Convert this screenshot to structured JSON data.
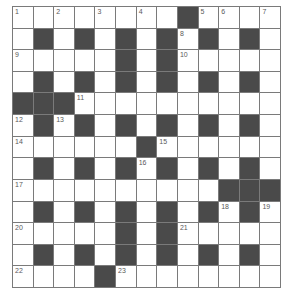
{
  "puzzle": {
    "type": "crossword",
    "rows": 13,
    "cols": 13,
    "colors": {
      "block": "#4a4a4a",
      "cell": "#ffffff",
      "border": "#7a7a7a",
      "number": "#5a5a5a"
    },
    "legend": "B = black square, . = empty white square, digits = clue number in white square",
    "grid": [
      [
        "1",
        ".",
        "2",
        ".",
        "3",
        ".",
        "4",
        ".",
        "B",
        "5",
        "6",
        ".",
        "7"
      ],
      [
        ".",
        "B",
        ".",
        "B",
        ".",
        "B",
        ".",
        "B",
        "8",
        "B",
        ".",
        "B",
        "."
      ],
      [
        "9",
        ".",
        ".",
        ".",
        ".",
        "B",
        ".",
        "B",
        "10",
        ".",
        ".",
        ".",
        "."
      ],
      [
        ".",
        "B",
        ".",
        "B",
        ".",
        "B",
        ".",
        "B",
        ".",
        "B",
        ".",
        "B",
        "."
      ],
      [
        "B",
        "B",
        "B",
        "11",
        ".",
        ".",
        ".",
        ".",
        ".",
        ".",
        ".",
        ".",
        "."
      ],
      [
        "12",
        "B",
        "13",
        "B",
        ".",
        "B",
        ".",
        "B",
        ".",
        "B",
        ".",
        "B",
        "."
      ],
      [
        "14",
        ".",
        ".",
        ".",
        ".",
        ".",
        "B",
        "15",
        ".",
        ".",
        ".",
        ".",
        "."
      ],
      [
        ".",
        "B",
        ".",
        "B",
        ".",
        "B",
        "16",
        "B",
        ".",
        "B",
        ".",
        "B",
        "."
      ],
      [
        "17",
        ".",
        ".",
        ".",
        ".",
        ".",
        ".",
        ".",
        ".",
        ".",
        "B",
        "B",
        "B"
      ],
      [
        ".",
        "B",
        ".",
        "B",
        ".",
        "B",
        ".",
        "B",
        ".",
        "B",
        "18",
        "B",
        "19"
      ],
      [
        "20",
        ".",
        ".",
        ".",
        ".",
        "B",
        ".",
        "B",
        "21",
        ".",
        ".",
        ".",
        "."
      ],
      [
        ".",
        "B",
        ".",
        "B",
        ".",
        "B",
        ".",
        "B",
        ".",
        "B",
        ".",
        "B",
        "."
      ],
      [
        "22",
        ".",
        ".",
        ".",
        "B",
        "23",
        ".",
        ".",
        ".",
        ".",
        ".",
        ".",
        "."
      ]
    ]
  }
}
